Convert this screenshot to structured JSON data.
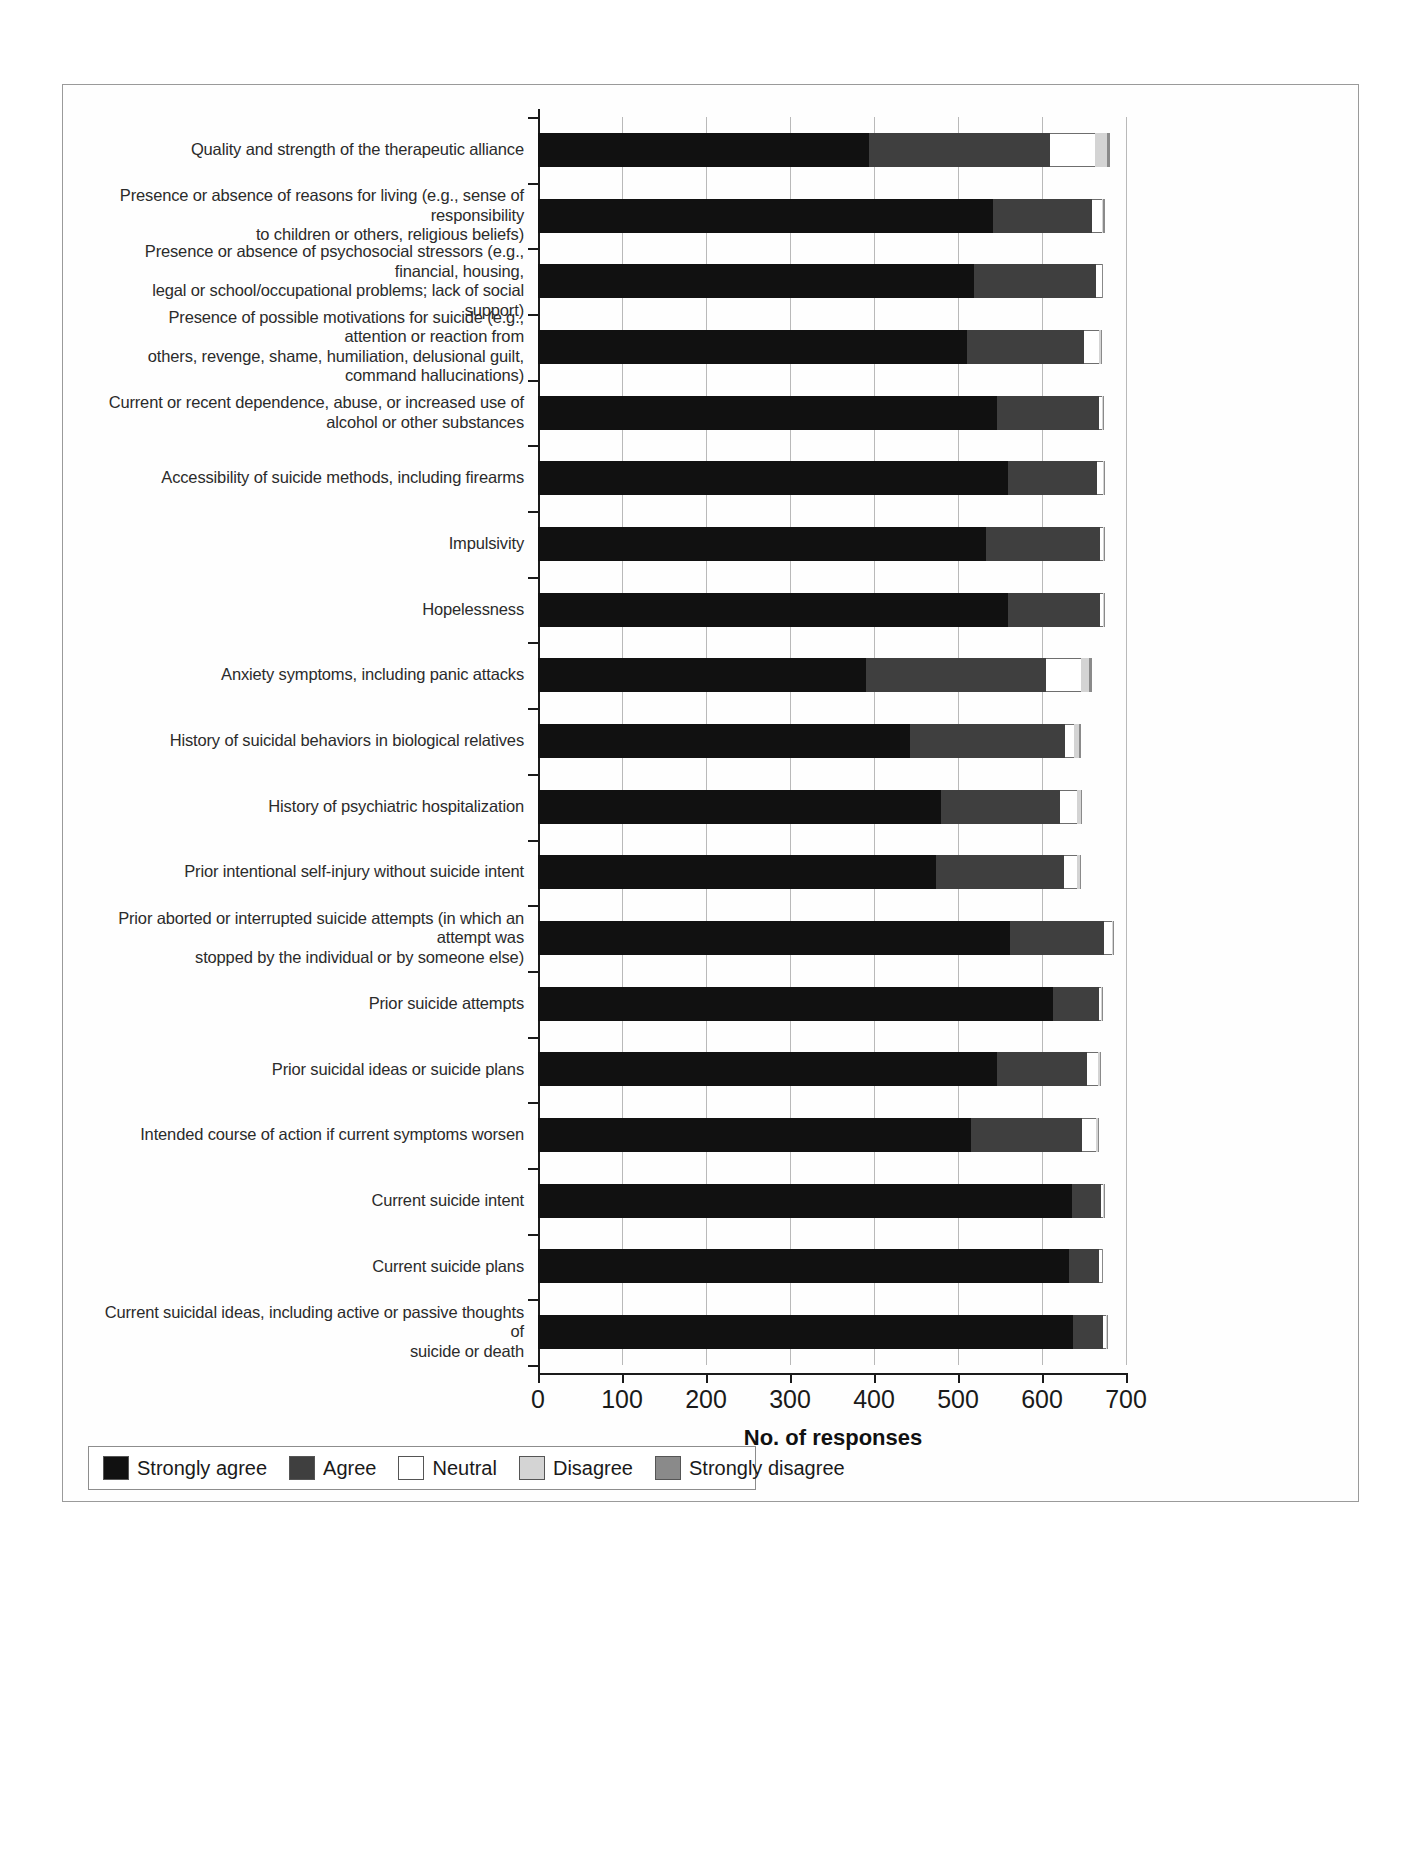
{
  "chart_data": {
    "type": "bar",
    "subtype": "stacked-horizontal-likert",
    "title": "",
    "xlabel": "No. of responses",
    "ylabel": "",
    "xlim": [
      0,
      700
    ],
    "xticks": [
      0,
      100,
      200,
      300,
      400,
      500,
      600,
      700
    ],
    "xtick_labels": [
      "0",
      "100",
      "200",
      "300",
      "400",
      "500",
      "600",
      "700"
    ],
    "grid": true,
    "legend_position": "bottom-left",
    "legend": [
      "Strongly agree",
      "Agree",
      "Neutral",
      "Disagree",
      "Strongly disagree"
    ],
    "series_colors": {
      "Strongly agree": "#111111",
      "Agree": "#3f3f3f",
      "Neutral": "#ffffff",
      "Disagree": "#d4d4d4",
      "Strongly disagree": "#8a8a8a"
    },
    "categories": [
      "Quality and strength of the therapeutic alliance",
      "Presence or absence of reasons for living (e.g., sense of responsibility\nto children or others, religious beliefs)",
      "Presence or absence of psychosocial stressors (e.g., financial, housing,\nlegal or school/occupational problems; lack of social support)",
      "Presence of possible motivations for suicide (e.g., attention or reaction from\nothers, revenge, shame, humiliation, delusional guilt, command hallucinations)",
      "Current or recent dependence, abuse, or increased use of\nalcohol or other substances",
      "Accessibility of suicide methods, including firearms",
      "Impulsivity",
      "Hopelessness",
      "Anxiety symptoms, including panic attacks",
      "History of suicidal behaviors in biological relatives",
      "History of psychiatric hospitalization",
      "Prior intentional self-injury without suicide intent",
      "Prior aborted or interrupted suicide attempts (in which an attempt was\nstopped by the individual or by someone else)",
      "Prior suicide attempts",
      "Prior suicidal ideas or suicide plans",
      "Intended course of action if current symptoms worsen",
      "Current suicide intent",
      "Current suicide plans",
      "Current suicidal ideas, including active or passive thoughts of\nsuicide or death"
    ],
    "series": [
      {
        "name": "Strongly agree",
        "values": [
          394,
          542,
          519,
          511,
          546,
          560,
          533,
          559,
          390,
          443,
          480,
          474,
          562,
          613,
          546,
          516,
          636,
          632,
          637
        ]
      },
      {
        "name": "Agree",
        "values": [
          215,
          118,
          145,
          139,
          122,
          105,
          136,
          110,
          215,
          184,
          142,
          152,
          112,
          55,
          107,
          132,
          34,
          36,
          36
        ]
      },
      {
        "name": "Neutral",
        "values": [
          54,
          11,
          7,
          18,
          4,
          8,
          4,
          4,
          42,
          11,
          20,
          16,
          9,
          2,
          14,
          16,
          3,
          3,
          3
        ]
      },
      {
        "name": "Disagree",
        "values": [
          14,
          2,
          1,
          2,
          1,
          1,
          1,
          1,
          9,
          6,
          4,
          3,
          2,
          1,
          2,
          3,
          1,
          1,
          1
        ]
      },
      {
        "name": "Strongly disagree",
        "values": [
          4,
          2,
          1,
          1,
          1,
          1,
          1,
          1,
          3,
          2,
          2,
          2,
          1,
          1,
          1,
          1,
          1,
          1,
          1
        ]
      }
    ]
  }
}
